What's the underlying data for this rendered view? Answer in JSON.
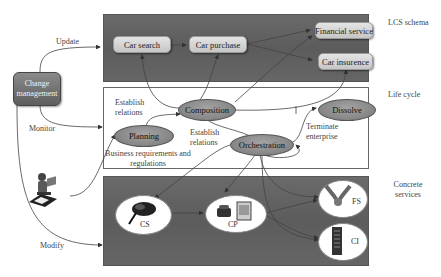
{
  "layers": {
    "lcs_schema": "LCS schema",
    "life_cycle": "Life cycle",
    "concrete_services_line1": "Concrete",
    "concrete_services_line2": "services"
  },
  "change_management": {
    "line1": "Change",
    "line2": "management"
  },
  "lcs_nodes": {
    "car_search": "Car search",
    "car_purchase": "Car purchase",
    "financial_service": "Financial service",
    "car_insurance": "Car insurence"
  },
  "lifecycle_nodes": {
    "composition": "Composition",
    "planning": "Planning",
    "orchestration": "Orchestration",
    "dissolve": "Dissolve"
  },
  "edge_labels": {
    "update": "Update",
    "monitor": "Monitor",
    "modify": "Modify",
    "establish_relations_1_line1": "Establish",
    "establish_relations_1_line2": "relations",
    "establish_relations_2_line1": "Establish",
    "establish_relations_2_line2": "relations",
    "terminate_line1": "Terminate",
    "terminate_line2": "enterprise",
    "business_req_line1": "Business requirements and",
    "business_req_line2": "regulations"
  },
  "services": {
    "cs": "CS",
    "cp": "CP",
    "fs": "FS",
    "ci": "CI"
  },
  "icons": {
    "user": "person-at-laptop-icon",
    "cs": "car-icon",
    "cp": "phone-and-document-icon",
    "fs": "handshake-icon",
    "ci": "server-tower-icon"
  },
  "colors": {
    "dark_panel": "#616161",
    "node_fill": "#d2d2d2",
    "ellipse_fill": "#8c8c8c",
    "arrow": "#3a3a3a"
  }
}
